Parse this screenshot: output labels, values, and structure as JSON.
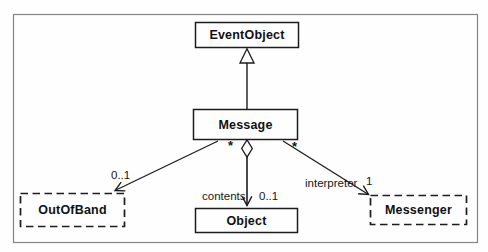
{
  "diagram": {
    "kind": "uml-class-diagram",
    "classes": [
      {
        "name": "EventObject",
        "border": "solid"
      },
      {
        "name": "Message",
        "border": "solid"
      },
      {
        "name": "OutOfBand",
        "border": "dashed"
      },
      {
        "name": "Object",
        "border": "solid"
      },
      {
        "name": "Messenger",
        "border": "dashed"
      }
    ],
    "edges": [
      {
        "from": "Message",
        "to": "EventObject",
        "type": "generalization"
      },
      {
        "from": "Message",
        "to": "OutOfBand",
        "type": "association",
        "end_multiplicity": "0..1"
      },
      {
        "from": "Message",
        "to": "Object",
        "type": "aggregation",
        "label": "contents",
        "start_multiplicity": "*",
        "end_multiplicity": "0..1"
      },
      {
        "from": "Message",
        "to": "Messenger",
        "type": "association",
        "label": "interpreter",
        "start_multiplicity": "*",
        "end_multiplicity": "1"
      }
    ],
    "colors": {
      "line": "#1c1c1c",
      "frame": "#858585",
      "background": "#fefefe",
      "text": "#111111"
    }
  }
}
